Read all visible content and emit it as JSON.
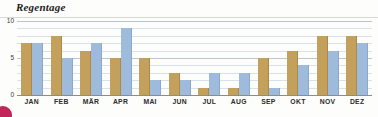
{
  "chart_data": {
    "type": "bar",
    "title": "Regentage",
    "xlabel": "",
    "ylabel": "",
    "ylim": [
      0,
      10
    ],
    "yticks": [
      0,
      5,
      10
    ],
    "ytick_labels": [
      "0",
      "5",
      "10"
    ],
    "grid": true,
    "grid_step": 1,
    "legend": "none",
    "categories": [
      "JAN",
      "FEB",
      "MÄR",
      "APR",
      "MAI",
      "JUN",
      "JUL",
      "AUG",
      "SEP",
      "OKT",
      "NOV",
      "DEZ"
    ],
    "series": [
      {
        "name": "series-a",
        "color": "#c3a15c",
        "values": [
          7,
          8,
          6,
          5,
          5,
          3,
          1,
          1,
          5,
          6,
          8,
          8
        ]
      },
      {
        "name": "series-b",
        "color": "#9ebbdc",
        "values": [
          7,
          5,
          7,
          9,
          2,
          2,
          3,
          3,
          1,
          4,
          6,
          7
        ]
      }
    ]
  },
  "decor": {
    "corner_mark_color": "#c0265a",
    "corner_mark_name": "magenta-circle"
  }
}
